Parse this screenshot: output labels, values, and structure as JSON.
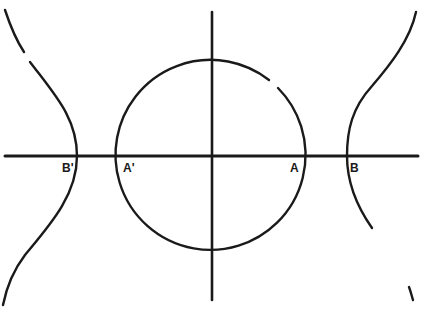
{
  "diagram": {
    "type": "circle and hyperbola on axes",
    "colors": {
      "ink": "#1a1a1a",
      "background": "#ffffff"
    },
    "axes": {
      "horizontal": {
        "x1": 5,
        "x2": 418,
        "y": 156
      },
      "vertical": {
        "x": 212,
        "y1": 12,
        "y2": 300
      }
    },
    "circle": {
      "cx": 212,
      "cy": 156,
      "r": 95
    },
    "hyperbola": {
      "left_vertex_x": 77,
      "right_vertex_x": 347
    },
    "labels": [
      {
        "id": "B_prime",
        "text": "B'",
        "x": 62,
        "y": 172
      },
      {
        "id": "A_prime",
        "text": "A'",
        "x": 123,
        "y": 172
      },
      {
        "id": "A",
        "text": "A",
        "x": 290,
        "y": 172
      },
      {
        "id": "B",
        "text": "B",
        "x": 350,
        "y": 172
      }
    ]
  }
}
